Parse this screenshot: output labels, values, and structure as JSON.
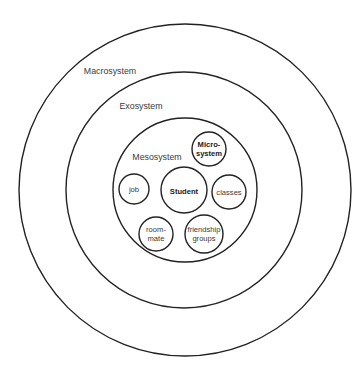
{
  "diagram": {
    "type": "nested-circles",
    "rings": [
      {
        "label": "Macrosystem",
        "cx": 185,
        "cy": 190,
        "r": 166,
        "label_x": 110,
        "label_y": 74
      },
      {
        "label": "Exosystem",
        "cx": 184,
        "cy": 190,
        "r": 118,
        "label_x": 141,
        "label_y": 109
      },
      {
        "label": "Mesosystem",
        "cx": 185,
        "cy": 190,
        "r": 72,
        "label_x": 157,
        "label_y": 160
      }
    ],
    "nodes": [
      {
        "id": "student",
        "lines": [
          "Student"
        ],
        "bold": true,
        "cx": 184,
        "cy": 190,
        "r": 23
      },
      {
        "id": "microsystem",
        "lines": [
          "Micro-",
          "system"
        ],
        "bold": true,
        "cx": 209,
        "cy": 149,
        "r": 17
      },
      {
        "id": "job",
        "lines": [
          "job"
        ],
        "bold": false,
        "cx": 134,
        "cy": 189,
        "r": 15
      },
      {
        "id": "classes",
        "lines": [
          "classes"
        ],
        "bold": false,
        "cx": 229,
        "cy": 192,
        "r": 17
      },
      {
        "id": "roommate",
        "lines": [
          "room-",
          "mate"
        ],
        "bold": false,
        "cx": 156,
        "cy": 234,
        "r": 17
      },
      {
        "id": "friendship-groups",
        "lines": [
          "friendship",
          "groups"
        ],
        "bold": false,
        "cx": 204,
        "cy": 234,
        "r": 19
      }
    ]
  }
}
